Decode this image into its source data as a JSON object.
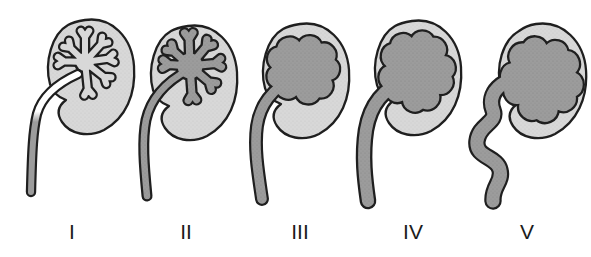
{
  "figure": {
    "name": "kidney-reflux-grading-diagram",
    "grade_labels": [
      {
        "label": "I"
      },
      {
        "label": "II"
      },
      {
        "label": "III"
      },
      {
        "label": "IV"
      },
      {
        "label": "V"
      }
    ]
  },
  "colors": {
    "background": "#ffffff",
    "outline": "#1f1f1f",
    "kidney_body": "#d8d8d8",
    "dilated_fluid": "#9c9c9c",
    "grade1_upper_ureter": "#ffffff",
    "label_text": "#1c1c1c"
  }
}
